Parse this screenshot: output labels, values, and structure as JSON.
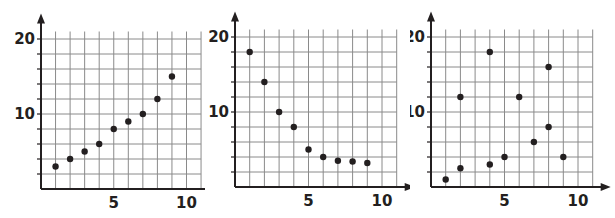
{
  "chart_data": [
    {
      "type": "scatter",
      "title": "",
      "xlabel": "",
      "ylabel": "",
      "xlim": [
        0,
        11
      ],
      "ylim": [
        0,
        21
      ],
      "x_ticks_labeled": [
        5,
        10
      ],
      "y_ticks_labeled": [
        10,
        20
      ],
      "grid": {
        "x_step": 1,
        "y_step": 2
      },
      "legend": null,
      "points": [
        {
          "x": 1,
          "y": 3
        },
        {
          "x": 2,
          "y": 4
        },
        {
          "x": 3,
          "y": 5
        },
        {
          "x": 4,
          "y": 6
        },
        {
          "x": 5,
          "y": 8
        },
        {
          "x": 6,
          "y": 9
        },
        {
          "x": 7,
          "y": 10
        },
        {
          "x": 8,
          "y": 12
        },
        {
          "x": 9,
          "y": 15
        }
      ]
    },
    {
      "type": "scatter",
      "title": "",
      "xlabel": "",
      "ylabel": "",
      "xlim": [
        0,
        11
      ],
      "ylim": [
        0,
        21
      ],
      "x_ticks_labeled": [
        5,
        10
      ],
      "y_ticks_labeled": [
        10,
        20
      ],
      "grid": {
        "x_step": 1,
        "y_step": 2
      },
      "legend": null,
      "points": [
        {
          "x": 1,
          "y": 18
        },
        {
          "x": 2,
          "y": 14
        },
        {
          "x": 3,
          "y": 10
        },
        {
          "x": 4,
          "y": 8
        },
        {
          "x": 5,
          "y": 5
        },
        {
          "x": 6,
          "y": 4
        },
        {
          "x": 7,
          "y": 3.5
        },
        {
          "x": 8,
          "y": 3.4
        },
        {
          "x": 9,
          "y": 3.2
        }
      ]
    },
    {
      "type": "scatter",
      "title": "",
      "xlabel": "",
      "ylabel": "",
      "xlim": [
        0,
        11
      ],
      "ylim": [
        0,
        21
      ],
      "x_ticks_labeled": [
        5,
        10
      ],
      "y_ticks_labeled": [
        10,
        20
      ],
      "grid": {
        "x_step": 1,
        "y_step": 2
      },
      "legend": null,
      "points": [
        {
          "x": 1,
          "y": 1
        },
        {
          "x": 2,
          "y": 2.5
        },
        {
          "x": 2,
          "y": 12
        },
        {
          "x": 4,
          "y": 3
        },
        {
          "x": 4,
          "y": 18
        },
        {
          "x": 5,
          "y": 4
        },
        {
          "x": 6,
          "y": 12
        },
        {
          "x": 7,
          "y": 6
        },
        {
          "x": 8,
          "y": 8
        },
        {
          "x": 8,
          "y": 16
        },
        {
          "x": 9,
          "y": 4
        }
      ]
    }
  ],
  "colors": {
    "axis": "#231f20",
    "grid": "#8a8a8a",
    "point": "#231f20",
    "background": "#ffffff"
  },
  "layout": {
    "panels": [
      {
        "left": 0,
        "origin_x": 41,
        "origin_y": 189,
        "x_unit": 14.55,
        "y_unit": 7.5
      },
      {
        "left": 205,
        "origin_x": 30,
        "origin_y": 187,
        "x_unit": 14.7,
        "y_unit": 7.5
      },
      {
        "left": 410,
        "origin_x": 21,
        "origin_y": 187,
        "x_unit": 14.7,
        "y_unit": 7.5
      }
    ]
  }
}
